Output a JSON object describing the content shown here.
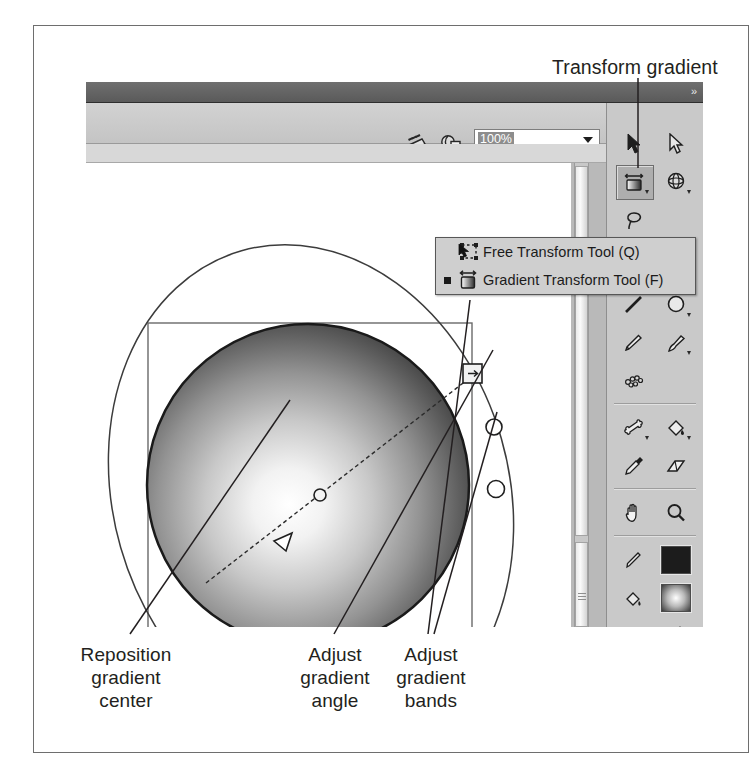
{
  "figure": {
    "caption_labels": {
      "transform_gradient": "Transform gradient",
      "reposition_gradient_center": "Reposition\ngradient\ncenter",
      "adjust_gradient_angle": "Adjust\ngradient\nangle",
      "adjust_gradient_bands": "Adjust\ngradient\nbands"
    }
  },
  "app": {
    "toolbar": {
      "zoom_value": "100%",
      "zoom_dropdown_arrow": "dropdown-arrow-icon",
      "scene_icon": "scene-icon",
      "symbol_icon": "edit-symbol-icon"
    },
    "titlebar": {
      "collapse_chevrons": "»"
    }
  },
  "tool_dropdown": {
    "items": [
      {
        "label": "Free Transform Tool (Q)",
        "icon": "free-transform-icon",
        "selected": false
      },
      {
        "label": "Gradient Transform Tool (F)",
        "icon": "gradient-transform-icon",
        "selected": true
      }
    ]
  },
  "tool_palette": {
    "tools": [
      {
        "name": "selection-tool",
        "has_options": false,
        "selected": false
      },
      {
        "name": "subselection-tool",
        "has_options": false,
        "selected": false
      },
      {
        "name": "gradient-transform-tool",
        "has_options": true,
        "selected": true
      },
      {
        "name": "lasso-tool",
        "has_options": true,
        "selected": false
      },
      {
        "name": "3d-rotation-tool",
        "has_options": false,
        "selected": false
      },
      {
        "name": "pen-tool",
        "has_options": true,
        "selected": false
      },
      {
        "name": "text-tool",
        "has_options": false,
        "selected": false
      },
      {
        "name": "line-tool",
        "has_options": false,
        "selected": false
      },
      {
        "name": "oval-tool",
        "has_options": true,
        "selected": false
      },
      {
        "name": "pencil-tool",
        "has_options": false,
        "selected": false
      },
      {
        "name": "brush-tool",
        "has_options": true,
        "selected": false
      },
      {
        "name": "deco-tool",
        "has_options": false,
        "selected": false
      },
      {
        "name": "bone-tool",
        "has_options": true,
        "selected": false
      },
      {
        "name": "paint-bucket-tool",
        "has_options": true,
        "selected": false
      },
      {
        "name": "eyedropper-tool",
        "has_options": false,
        "selected": false
      },
      {
        "name": "eraser-tool",
        "has_options": false,
        "selected": false
      },
      {
        "name": "hand-tool",
        "has_options": false,
        "selected": false
      },
      {
        "name": "zoom-tool",
        "has_options": false,
        "selected": false
      },
      {
        "name": "stroke-color-tool",
        "has_options": false,
        "selected": false
      },
      {
        "name": "fill-color-tool",
        "has_options": false,
        "selected": false
      },
      {
        "name": "black-and-white-tool",
        "has_options": false,
        "selected": false
      },
      {
        "name": "swap-colors-tool",
        "has_options": false,
        "selected": false
      }
    ],
    "stroke_color": "#1c1c1c",
    "fill_color": "radial-gradient-white-to-black",
    "snap_to_objects": "magnet-icon"
  },
  "stage": {
    "artwork": {
      "shape": "sphere-with-radial-gradient",
      "selection_box": true,
      "gradient_handles": [
        {
          "name": "center-handle",
          "type": "circle"
        },
        {
          "name": "focal-point-handle",
          "type": "triangle"
        },
        {
          "name": "width-handle",
          "type": "square-with-arrow"
        },
        {
          "name": "rotation-handle",
          "type": "circle"
        },
        {
          "name": "size-handle",
          "type": "circle"
        }
      ],
      "gradient_radius_indicator": "ellipse-outline"
    }
  }
}
